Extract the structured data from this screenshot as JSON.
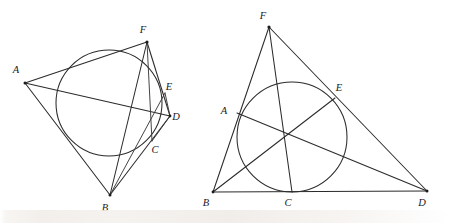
{
  "figure": {
    "caption": "",
    "background_color": "#ffffff",
    "ink_color": "#2b2b2b",
    "label_color": "#1a1a1a",
    "panels": [
      {
        "id": "left-panel",
        "name": "tangential-quadrilateral-with-incircle",
        "circle": {
          "cx": 109,
          "cy": 103,
          "r": 53
        },
        "points": [
          {
            "id": "A",
            "label": "A",
            "x": 25,
            "y": 83,
            "label_x": 16,
            "label_y": 73,
            "dot": true
          },
          {
            "id": "B",
            "label": "B",
            "x": 110,
            "y": 195,
            "label_x": 105,
            "label_y": 211,
            "dot": true
          },
          {
            "id": "C",
            "label": "C",
            "x": 152,
            "y": 141,
            "label_x": 155,
            "label_y": 153,
            "dot": false
          },
          {
            "id": "D",
            "label": "D",
            "x": 170,
            "y": 116,
            "label_x": 176,
            "label_y": 120,
            "dot": true
          },
          {
            "id": "E",
            "label": "E",
            "x": 165,
            "y": 93,
            "label_x": 169,
            "label_y": 90,
            "dot": false
          },
          {
            "id": "F",
            "label": "F",
            "x": 147,
            "y": 42,
            "label_x": 143,
            "label_y": 33,
            "dot": true
          }
        ],
        "segments": [
          {
            "from": "A",
            "to": "F",
            "name": "segment-AF"
          },
          {
            "from": "F",
            "to": "D",
            "name": "segment-FD"
          },
          {
            "from": "D",
            "to": "B",
            "name": "segment-DB"
          },
          {
            "from": "B",
            "to": "A",
            "name": "segment-BA"
          },
          {
            "from": "A",
            "to": "D",
            "name": "diagonal-AD"
          },
          {
            "from": "F",
            "to": "B",
            "name": "diagonal-FB"
          },
          {
            "from": "B",
            "to": "E",
            "name": "cevian-BE"
          },
          {
            "from": "F",
            "to": "C",
            "name": "cevian-FC"
          },
          {
            "from": "E",
            "to": "D",
            "name": "segment-ED"
          },
          {
            "from": "D",
            "to": "C",
            "name": "segment-DC"
          }
        ]
      },
      {
        "id": "right-panel",
        "name": "triangle-with-incircle-and-cevians",
        "circle": {
          "cx": 292,
          "cy": 137,
          "r": 55
        },
        "points": [
          {
            "id": "F",
            "label": "F",
            "x": 269,
            "y": 27,
            "label_x": 263,
            "label_y": 19,
            "dot": true
          },
          {
            "id": "A",
            "label": "A",
            "x": 237,
            "y": 113,
            "label_x": 224,
            "label_y": 114,
            "dot": false
          },
          {
            "id": "E",
            "label": "E",
            "x": 335,
            "y": 98,
            "label_x": 339,
            "label_y": 91,
            "dot": false
          },
          {
            "id": "B",
            "label": "B",
            "x": 213,
            "y": 192,
            "label_x": 206,
            "label_y": 206,
            "dot": true
          },
          {
            "id": "C",
            "label": "C",
            "x": 292,
            "y": 192,
            "label_x": 288,
            "label_y": 206,
            "dot": false
          },
          {
            "id": "D",
            "label": "D",
            "x": 427,
            "y": 191,
            "label_x": 422,
            "label_y": 206,
            "dot": true
          }
        ],
        "segments": [
          {
            "from": "F",
            "to": "B",
            "name": "segment-FB"
          },
          {
            "from": "F",
            "to": "D",
            "name": "segment-FD"
          },
          {
            "from": "B",
            "to": "D",
            "name": "baseline-BD"
          },
          {
            "from": "F",
            "to": "C",
            "name": "cevian-FC"
          },
          {
            "from": "B",
            "to": "E",
            "name": "cevian-BE"
          },
          {
            "from": "A",
            "to": "D",
            "name": "cevian-AD"
          }
        ]
      }
    ]
  }
}
